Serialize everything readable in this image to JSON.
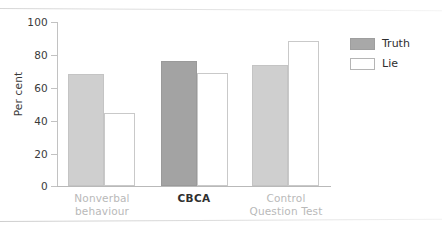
{
  "chart_data": {
    "type": "bar",
    "title": "",
    "xlabel": "",
    "ylabel": "Per cent",
    "ylim": [
      0,
      100
    ],
    "yticks": [
      0,
      20,
      40,
      60,
      80,
      100
    ],
    "ytick_labels": [
      "0",
      "20",
      "40",
      "60",
      "80",
      "100"
    ],
    "grid": false,
    "legend_position": "right",
    "categories": [
      "Nonverbal behaviour",
      "CBCA",
      "Control Question Test"
    ],
    "category_lines": [
      [
        "Nonverbal",
        "behaviour"
      ],
      [
        "CBCA",
        ""
      ],
      [
        "Control",
        "Question Test"
      ]
    ],
    "series": [
      {
        "name": "Truth",
        "values": [
          68,
          76.5,
          74
        ]
      },
      {
        "name": "Lie",
        "values": [
          44.5,
          69,
          88.5
        ]
      }
    ]
  },
  "axes": {
    "y_title": "Per cent",
    "y_labels": {
      "t100": "100",
      "t80": "80",
      "t60": "60",
      "t40": "40",
      "t20": "20",
      "t0": "0"
    }
  },
  "categories": {
    "g1_line1": "Nonverbal",
    "g1_line2": "behaviour",
    "g2_line1": "CBCA",
    "g3_line1": "Control",
    "g3_line2": "Question Test"
  },
  "legend": {
    "truth_label": "Truth",
    "lie_label": "Lie"
  },
  "colors": {
    "truth_light": "#cfcfcf",
    "truth_dark": "#a3a3a3",
    "lie_fill": "#ffffff",
    "lie_border": "#c9c9c9",
    "axis": "#c2c2c2",
    "muted_text": "#b9b9b9",
    "text": "#2f2f2f"
  }
}
